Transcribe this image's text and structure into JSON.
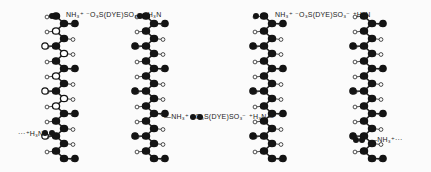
{
  "figure": {
    "colors": {
      "atom_dark": "#141414",
      "atom_light": "#ffffff",
      "bond": "#222222",
      "background": "#fbfbfb"
    },
    "chains": [
      {
        "id": "chain-1",
        "x": 60,
        "top": 16,
        "bottom": 160,
        "style": "open",
        "open_atoms": [
          30,
          52,
          75,
          98,
          108
        ]
      },
      {
        "id": "chain-2",
        "x": 150,
        "top": 16,
        "bottom": 160,
        "style": "filled"
      },
      {
        "id": "chain-3",
        "x": 268,
        "top": 16,
        "bottom": 160,
        "style": "filled"
      },
      {
        "id": "chain-4",
        "x": 368,
        "top": 16,
        "bottom": 160,
        "style": "filled"
      }
    ],
    "labels": {
      "top_left_bridge": "NH₃⁺ ⁻O₃S(DYE)SO₃⁻ ⁺H₃N",
      "top_right_bridge": "NH₃⁺ ⁻O₃S(DYE)SO₃⁻ ⁺H₃N",
      "middle_bridge": "—NH₃⁺ ⁻O₃S(DYE)SO₃⁻ ⁺H₃N—",
      "left_end": "···⁺H₃N—",
      "right_end": "—NH₃⁺···"
    }
  }
}
